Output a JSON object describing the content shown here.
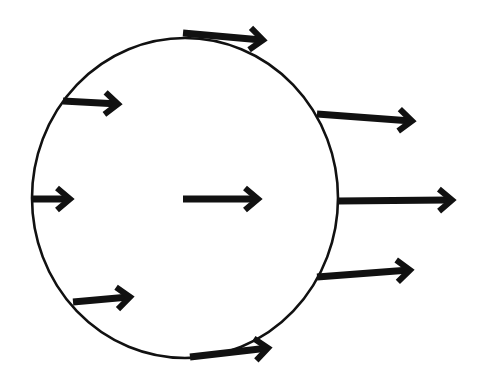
{
  "diagram": {
    "colors": {
      "stroke": "#111111",
      "background": "#ffffff"
    },
    "circle": {
      "cx": 185,
      "cy": 198,
      "rx": 153,
      "ry": 160
    },
    "arrows": [
      {
        "id": "top",
        "x1": 183,
        "y1": 33,
        "x2": 263,
        "y2": 40
      },
      {
        "id": "upper-left",
        "x1": 63,
        "y1": 101,
        "x2": 118,
        "y2": 104
      },
      {
        "id": "left",
        "x1": 33,
        "y1": 199,
        "x2": 70,
        "y2": 199
      },
      {
        "id": "lower-left",
        "x1": 73,
        "y1": 302,
        "x2": 130,
        "y2": 297
      },
      {
        "id": "bottom",
        "x1": 190,
        "y1": 357,
        "x2": 268,
        "y2": 348
      },
      {
        "id": "center",
        "x1": 183,
        "y1": 199,
        "x2": 258,
        "y2": 199
      },
      {
        "id": "right-upper",
        "x1": 317,
        "y1": 114,
        "x2": 412,
        "y2": 121
      },
      {
        "id": "right-middle",
        "x1": 338,
        "y1": 201,
        "x2": 452,
        "y2": 200
      },
      {
        "id": "right-lower",
        "x1": 317,
        "y1": 277,
        "x2": 410,
        "y2": 270
      }
    ]
  }
}
